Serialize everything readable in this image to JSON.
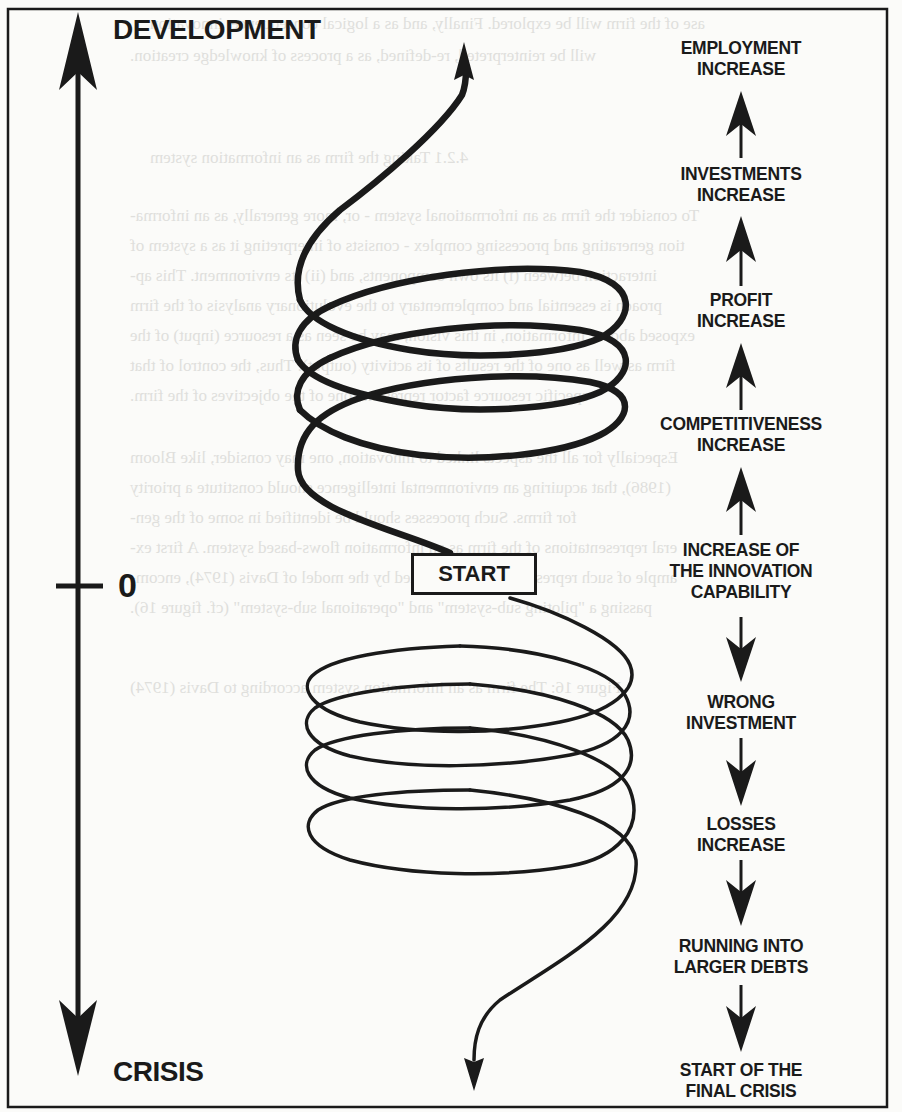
{
  "diagram": {
    "axis": {
      "top_label": "DEVELOPMENT",
      "bottom_label": "CRISIS",
      "origin_label": "0"
    },
    "spiral": {
      "start_label": "START",
      "upper_direction": "up",
      "lower_direction": "down"
    },
    "stages_up": [
      {
        "line1": "EMPLOYMENT",
        "line2": "INCREASE",
        "line3": ""
      },
      {
        "line1": "INVESTMENTS",
        "line2": "INCREASE",
        "line3": ""
      },
      {
        "line1": "PROFIT",
        "line2": "INCREASE",
        "line3": ""
      },
      {
        "line1": "COMPETITIVENESS",
        "line2": "INCREASE",
        "line3": ""
      },
      {
        "line1": "INCREASE OF",
        "line2": "THE INNOVATION",
        "line3": "CAPABILITY"
      }
    ],
    "stages_down": [
      {
        "line1": "WRONG",
        "line2": "INVESTMENT"
      },
      {
        "line1": "LOSSES",
        "line2": "INCREASE"
      },
      {
        "line1": "RUNNING INTO",
        "line2": "LARGER DEBTS"
      },
      {
        "line1": "START OF THE",
        "line2": "FINAL CRISIS"
      }
    ],
    "colors": {
      "ink": "#1a1a1a",
      "paper": "#fbfbf9",
      "bleed_through": "#c9c9c6"
    }
  },
  "background_bleed": {
    "lines": [
      "ase of the firm will be explored. Finally, and as a logical consequence, innovation",
      "will be reinterpreted, re-defined, as a process of knowledge creation.",
      "4.2.1   Taking the firm as an information system",
      "To consider the firm as an informational system - or, more generally, as an informa-",
      "tion generating and processing complex - consists of interpreting it as a system of",
      "interaction between (i) its own components, and (ii) its environment. This ap-",
      "proach is essential and complementary to the evolutionary analysis of the firm",
      "exposed above. Information, in this vision, may be seen as a resource (input) of the",
      "firm as well as one of the results of its activity (output). Thus, the control of that",
      "specific resource factor represents one of the objectives of the firm.",
      "Especially for all the aspects linked to innovation, one may consider, like Bloom",
      "(1986), that acquiring an environmental intelligence should constitute a priority",
      "for firms. Such processes should be identified in some of the gen-",
      "eral representations of the firm as an information flows-based system. A first ex-",
      "ample of such representations is provided by the model of Davis (1974), encom-",
      "passing a \"piloting sub-system\" and \"operational sub-system\" (cf. figure 16).",
      "Figure 16:   The firm as an information system according to Davis (1974)"
    ]
  }
}
